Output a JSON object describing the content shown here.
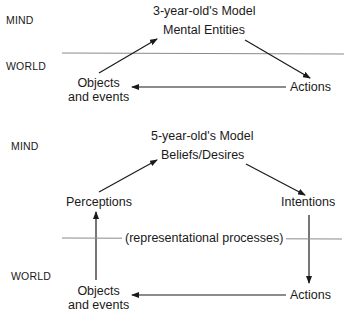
{
  "colors": {
    "text": "#1a1a1a",
    "arrow": "#1a1a1a",
    "divider": "#8a8a8a",
    "background": "#ffffff"
  },
  "model3": {
    "side_labels": {
      "mind": "MIND",
      "world": "WORLD"
    },
    "title": "3-year-old's Model",
    "nodes": {
      "mental_entities": "Mental Entities",
      "objects_line1": "Objects",
      "objects_line2": "and events",
      "actions": "Actions"
    },
    "edges": [
      {
        "from": "Objects and events",
        "to": "Mental Entities"
      },
      {
        "from": "Mental Entities",
        "to": "Actions"
      },
      {
        "from": "Actions",
        "to": "Objects and events"
      }
    ]
  },
  "model5": {
    "side_labels": {
      "mind": "MIND",
      "world": "WORLD"
    },
    "title": "5-year-old's Model",
    "nodes": {
      "beliefs_desires": "Beliefs/Desires",
      "perceptions": "Perceptions",
      "intentions": "Intentions",
      "objects_line1": "Objects",
      "objects_line2": "and events",
      "actions": "Actions"
    },
    "divider_label": "(representational processes)",
    "edges": [
      {
        "from": "Objects and events",
        "to": "Perceptions"
      },
      {
        "from": "Perceptions",
        "to": "Beliefs/Desires"
      },
      {
        "from": "Beliefs/Desires",
        "to": "Intentions"
      },
      {
        "from": "Intentions",
        "to": "Actions"
      },
      {
        "from": "Actions",
        "to": "Objects and events"
      }
    ]
  }
}
